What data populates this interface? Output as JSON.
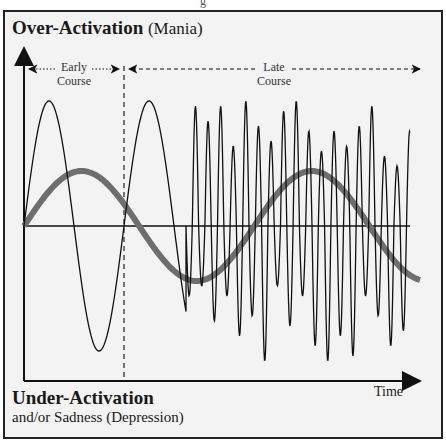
{
  "caption_fragment": "g",
  "top_label": {
    "bold": "Over-Activation",
    "normal": "(Mania)"
  },
  "bottom_label": {
    "bold": "Under-Activation",
    "normal": "and/or Sadness (Depression)"
  },
  "x_axis_label": "Time",
  "phases": [
    {
      "line1": "Early",
      "line2": "Course"
    },
    {
      "line1": "Late",
      "line2": "Course"
    }
  ],
  "colors": {
    "background": "#f3f3f3",
    "line": "#111111",
    "mood_curve": "#6e6e6e",
    "border": "#222222"
  },
  "chart_data": {
    "type": "line",
    "title": "",
    "xlabel": "Time",
    "ylabel_top": "Over-Activation (Mania)",
    "ylabel_bottom": "Under-Activation and/or Sadness (Depression)",
    "series": [
      {
        "name": "Slow mood cycle (thick gray)",
        "description": "Slow sine wave, amplitude ~0.5, peaks early, trough mid, peak late, descending at end"
      },
      {
        "name": "Early course episodes (thin)",
        "description": "Two long, large-amplitude oscillations before the dashed divider"
      },
      {
        "name": "Late course episodes (thin)",
        "description": "Rapid, irregular high-frequency oscillations after the dashed divider"
      }
    ],
    "annotations": [
      "Early Course",
      "Late Course"
    ],
    "divider_position_fraction": 0.25,
    "grid": false
  }
}
